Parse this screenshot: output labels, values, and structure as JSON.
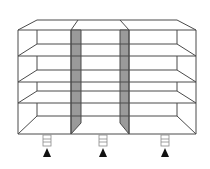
{
  "diagram": {
    "title": "Three-column shelving unit with leveling feet",
    "colors": {
      "line": "#4a4a4a",
      "shaded_panel": "#9a9a9a",
      "arrow": "#111111",
      "background": "#ffffff"
    },
    "frame": {
      "front_left": 18,
      "front_right": 196,
      "top": 30,
      "bottom": 134,
      "back_left": 37,
      "back_right": 177,
      "back_top": 20
    },
    "columns": [
      {
        "id": "left",
        "front_x": [
          18,
          71
        ],
        "back_x": [
          37,
          81
        ],
        "shaded": false
      },
      {
        "id": "middle",
        "front_x": [
          71,
          129
        ],
        "back_x": [
          81,
          120
        ],
        "shaded": true
      },
      {
        "id": "right",
        "front_x": [
          129,
          196
        ],
        "back_x": [
          120,
          177
        ],
        "shaded": false
      }
    ],
    "shelf_levels": [
      {
        "front_y": 56,
        "back_y": 44
      },
      {
        "front_y": 82,
        "back_y": 70
      },
      {
        "front_y": 103,
        "back_y": 91
      }
    ],
    "feet": [
      {
        "x": 47,
        "label": "leveling-foot"
      },
      {
        "x": 103,
        "label": "leveling-foot"
      },
      {
        "x": 165,
        "label": "leveling-foot"
      }
    ],
    "foot_symbol": "up-arrow"
  }
}
